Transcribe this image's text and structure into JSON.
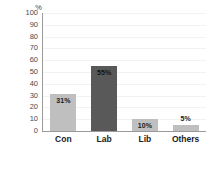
{
  "chart_data": {
    "type": "bar",
    "title": "",
    "xlabel": "",
    "ylabel": "%",
    "unit_label": "%",
    "categories": [
      "Con",
      "Lab",
      "Lib",
      "Others"
    ],
    "values": [
      31,
      55,
      10,
      5
    ],
    "data_labels": [
      "31%",
      "55%",
      "10%",
      "5%"
    ],
    "label_placement": [
      "inside",
      "inside",
      "inside",
      "above"
    ],
    "bar_colors": [
      "#bfbfbf",
      "#595959",
      "#bfbfbf",
      "#bfbfbf"
    ],
    "ylim": [
      0,
      100
    ],
    "ytick_values": [
      100,
      90,
      80,
      70,
      60,
      50,
      40,
      30,
      20,
      10,
      0
    ],
    "ytick_labels": [
      "100",
      "90",
      "80",
      "70",
      "60",
      "50",
      "40",
      "30",
      "20",
      "10",
      "0"
    ],
    "grid": true,
    "grid_color": "#f2f2f2",
    "axis_color": "#9a9a9a",
    "legend": false,
    "background": "#ffffff"
  }
}
